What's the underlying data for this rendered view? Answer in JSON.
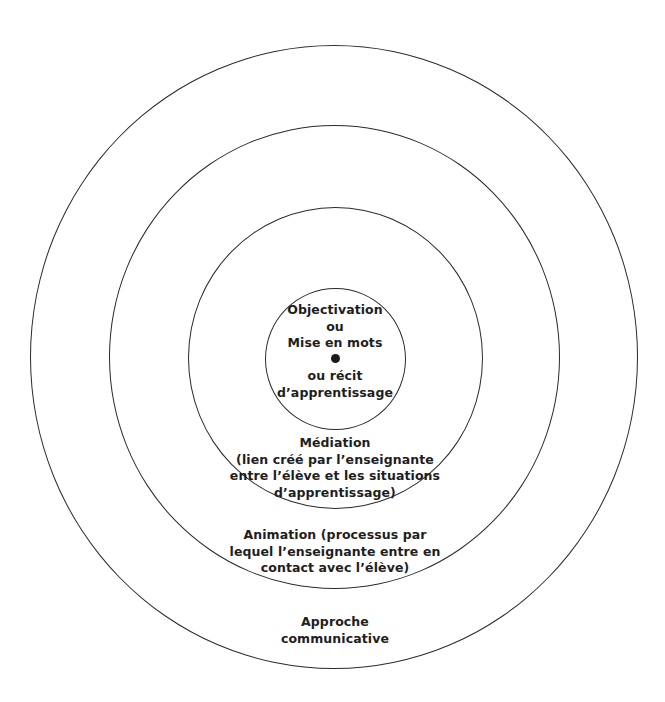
{
  "diagram": {
    "type": "concentric-circles",
    "rings": [
      {
        "level": 1,
        "name": "Objectivation",
        "lines_above_center": [
          "Objectivation",
          "ou",
          "Mise en mots"
        ],
        "lines_below_center": [
          "ou récit",
          "d’apprentissage"
        ]
      },
      {
        "level": 2,
        "name": "Médiation",
        "lines": [
          "Médiation",
          "(lien créé par l’enseignante",
          "entre l’élève et les situations",
          "d’apprentissage)"
        ]
      },
      {
        "level": 3,
        "name": "Animation",
        "lines": [
          "Animation (processus par",
          "lequel l’enseignante entre en",
          "contact avec l’élève)"
        ]
      },
      {
        "level": 4,
        "name": "Approche communicative",
        "lines": [
          "Approche",
          "communicative"
        ]
      }
    ],
    "center_marker": "filled-dot",
    "colors": {
      "stroke": "#2a2a2a",
      "text": "#1e1e1e",
      "background": "#ffffff"
    }
  }
}
